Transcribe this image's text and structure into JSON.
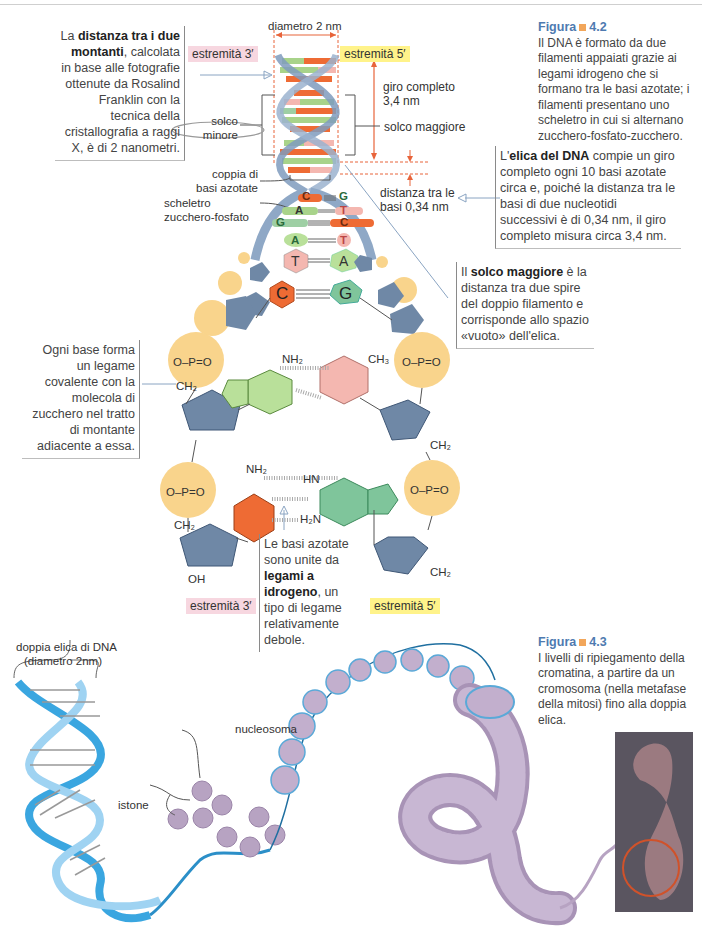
{
  "figure_4_2": {
    "caption": {
      "label": "Figura",
      "number": "4.2",
      "text": "Il DNA è formato da due filamenti appaiati grazie ai legami idrogeno che si formano tra le basi azotate; i filamenti presentano uno scheletro in cui si alternano zucchero-fosfato-zucchero."
    },
    "callout_distance": {
      "prefix": "La ",
      "bold": "distanza tra i due montanti",
      "text": ", calcolata in base alle fotografie ottenute da Rosalind Franklin con la tecnica della cristallografia a raggi X, è di",
      "highlight": "2 nanometri."
    },
    "callout_helix": {
      "prefix": "L'",
      "bold": "elica del DNA",
      "text": " compie un giro completo ogni 10 basi azotate circa e, poiché la distanza tra le basi di due nucleotidi successivi è di 0,34 nm, il giro completo misura circa 3,4 nm."
    },
    "callout_groove": {
      "prefix": "Il ",
      "bold": "solco maggiore",
      "text": " è la distanza tra due spire del doppio filamento e corrisponde allo spazio «vuoto» dell'elica."
    },
    "callout_covalent": {
      "text": "Ogni base forma un legame covalente con la molecola di zucchero nel tratto di montante adiacente a essa."
    },
    "callout_hbond": {
      "prefix": "Le basi azotate sono unite da ",
      "bold": "legami a idrogeno",
      "text": ", un tipo di legame relativamente debole."
    },
    "labels": {
      "diameter": "diametro 2 nm",
      "end3_top": "estremità 3′",
      "end5_top": "estremità 5′",
      "full_turn": "giro completo",
      "full_turn_value": "3,4 nm",
      "minor_groove_1": "solco",
      "minor_groove_2": "minore",
      "major_groove": "solco maggiore",
      "base_pair_1": "coppia di",
      "base_pair_2": "basi azotate",
      "backbone_1": "scheletro",
      "backbone_2": "zucchero-fosfato",
      "base_distance_1": "distanza tra le",
      "base_distance_2": "basi 0,34 nm",
      "end3_bottom": "estremità 3′",
      "end5_bottom": "estremità 5′"
    },
    "base_pairs": [
      {
        "left": "C",
        "right": "G"
      },
      {
        "left": "A",
        "right": "T"
      },
      {
        "left": "G",
        "right": "C"
      },
      {
        "left": "A",
        "right": "T"
      },
      {
        "left": "T",
        "right": "A"
      },
      {
        "left": "C",
        "right": "G"
      }
    ],
    "chem": {
      "phosphate": "O–P=O",
      "o": "O",
      "nh2": "NH₂",
      "ch3": "CH₃",
      "ch2": "CH₂",
      "oh": "OH",
      "h": "H",
      "n": "N",
      "hn": "HN",
      "h2n": "H₂N",
      "c": "C"
    }
  },
  "figure_4_3": {
    "caption": {
      "label": "Figura",
      "number": "4.3",
      "text": "I livelli di ripiegamento della cromatina, a partire da un cromosoma (nella metafase della mitosi) fino alla doppia elica."
    },
    "labels": {
      "dna_1": "doppia elica di DNA",
      "dna_2": "(diametro 2nm)",
      "nucleosome": "nucleosoma",
      "histone": "istone"
    }
  },
  "colors": {
    "caption_blue": "#4e7ab0",
    "accent_orange": "#f2a65a",
    "pink_tag": "#f7d7e0",
    "yellow_tag": "#fff38a",
    "dim_red": "#e8643a",
    "backbone_blue": "#6f88a6",
    "phosphate_yellow": "#f9d48c",
    "dna_blue": "#3aa6e0",
    "histone_purple": "#b7a3c2"
  }
}
